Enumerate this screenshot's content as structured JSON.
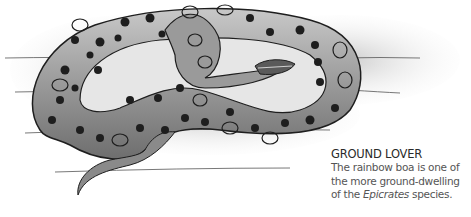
{
  "illustration": {
    "subject": "rainbow boa snake coiled on ground",
    "style": "grayscale pencil illustration"
  },
  "caption": {
    "title": "GROUND LOVER",
    "body_part1": "The rainbow boa is one of the more ground-dwelling of the ",
    "body_italic": "Epicrates",
    "body_part2": " species."
  },
  "colors": {
    "ink": "#1e1e1e",
    "body_gray": "#9a9a9a",
    "caption_text": "#555555"
  }
}
